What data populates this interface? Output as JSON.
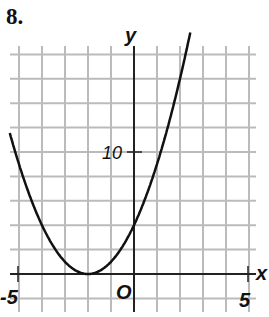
{
  "problem_number": "8.",
  "chart_data": {
    "type": "line",
    "title": "",
    "function": "y = (x + 2)^2",
    "xlabel": "x",
    "ylabel": "y",
    "xlim": [
      -5.4,
      5.5
    ],
    "ylim": [
      -1,
      19
    ],
    "x_tick_labels": [
      "-5",
      "5"
    ],
    "y_tick_labels": [
      "10"
    ],
    "origin_label": "O",
    "grid": true,
    "grid_x_step": 1,
    "grid_y_step": 2,
    "vertex": [
      -2,
      0
    ],
    "y_intercept": 4,
    "series": [
      {
        "name": "parabola",
        "x": [
          -5.4,
          -5,
          -4,
          -3,
          -2,
          -1,
          0,
          1,
          2,
          2.4
        ],
        "y": [
          11.56,
          9,
          4,
          1,
          0,
          1,
          4,
          9,
          16,
          19.36
        ]
      }
    ]
  },
  "labels": {
    "x_axis": "x",
    "y_axis": "y",
    "x_min": "-5",
    "x_max": "5",
    "y_ten": "10",
    "origin": "O"
  }
}
